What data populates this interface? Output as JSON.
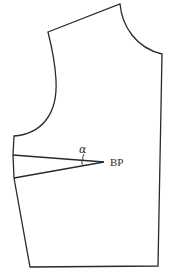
{
  "diagram": {
    "type": "garment-pattern",
    "colors": {
      "line": "#2a2a2a",
      "background": "#ffffff"
    },
    "labels": {
      "angle": "α",
      "bust_point": "BP"
    },
    "points": {
      "shoulder_tip": [
        48,
        32
      ],
      "neck_side": [
        120,
        4
      ],
      "center_front_neck": [
        162,
        54
      ],
      "center_front_hem": [
        158,
        266
      ],
      "side_hem": [
        30,
        267
      ],
      "underarm": [
        14,
        136
      ],
      "dart_upper_leg": [
        13,
        155
      ],
      "dart_lower_leg": [
        14,
        178
      ],
      "dart_apex_bp": [
        104,
        162
      ]
    }
  }
}
